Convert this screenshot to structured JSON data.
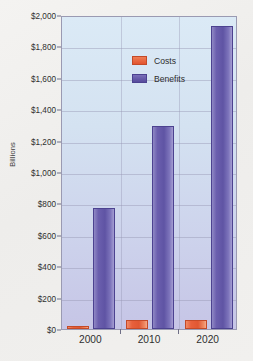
{
  "chart_data": {
    "type": "bar",
    "title": "",
    "xlabel": "",
    "ylabel": "Billions",
    "categories": [
      "2000",
      "2010",
      "2020"
    ],
    "series": [
      {
        "name": "Costs",
        "color": "#e8603c",
        "values": [
          20,
          55,
          60
        ]
      },
      {
        "name": "Benefits",
        "color": "#6b5fae",
        "values": [
          770,
          1295,
          1930
        ]
      }
    ],
    "ylim": [
      0,
      2000
    ],
    "ytick_values": [
      0,
      200,
      400,
      600,
      800,
      1000,
      1200,
      1400,
      1600,
      1800,
      2000
    ],
    "ytick_labels": [
      "$0",
      "$200",
      "$400",
      "$600",
      "$800",
      "$1,000",
      "$1,200",
      "$1,400",
      "$1,600",
      "$1,800",
      "$2,000"
    ],
    "grid": true,
    "legend_position": "top-left",
    "plot_background": "#d4e2f1",
    "page_background": "#f1f0ee"
  },
  "legend": {
    "items": [
      {
        "label": "Costs"
      },
      {
        "label": "Benefits"
      }
    ]
  }
}
